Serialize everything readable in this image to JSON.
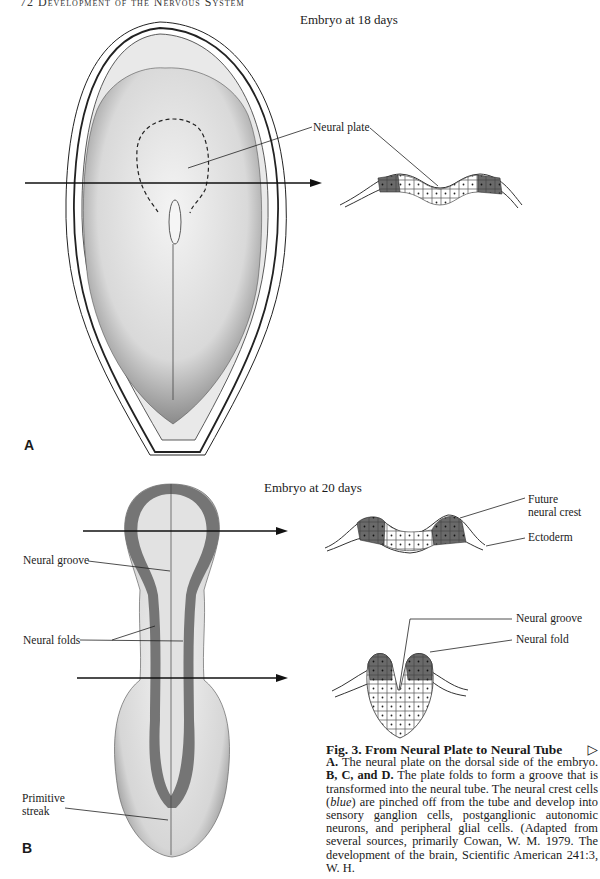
{
  "page": {
    "running_head": "72   Development of the Nervous System"
  },
  "panel_a": {
    "letter": "A",
    "title": "Embryo at 18 days",
    "labels": {
      "neural_plate": "Neural plate"
    }
  },
  "panel_b": {
    "letter": "B",
    "title": "Embryo at 20 days",
    "labels": {
      "neural_groove_left": "Neural groove",
      "neural_folds": "Neural folds",
      "primitive_streak_1": "Primitive",
      "primitive_streak_2": "streak",
      "future_neural_crest_1": "Future",
      "future_neural_crest_2": "neural crest",
      "ectoderm": "Ectoderm",
      "neural_groove_right": "Neural groove",
      "neural_fold": "Neural fold"
    }
  },
  "caption": {
    "title": "Fig. 3.  From Neural Plate to Neural Tube",
    "next_icon": "▷",
    "a_lead": "A.",
    "a_text": " The neural plate on the dorsal side of the embryo.",
    "bcd_lead": "B, C, and D.",
    "bcd_text_1": " The plate folds to form a groove that is transformed into the neural tube. The neural crest cells (",
    "blue_word": "blue",
    "bcd_text_2": ") are pinched off from the tube and develop into sensory ganglion cells, postganglionic autonomic neurons, and peripheral glial cells. (Adapted from several sources, primarily Cowan, W. M. 1979. The development of the brain, Scientific American 241:3, W. H."
  },
  "colors": {
    "neural_crest_shade": "#6a6a6a",
    "neural_fold_band": "#757575",
    "ink": "#1a1a1a"
  }
}
